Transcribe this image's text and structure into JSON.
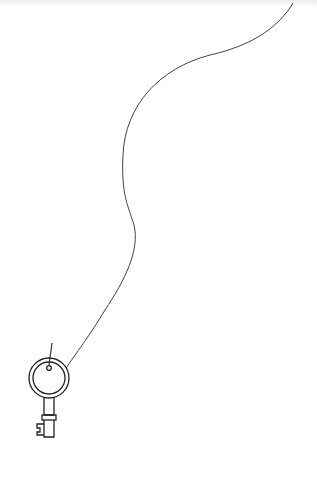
{
  "illustration": {
    "subject": "key hanging from a string",
    "background_color": "#ffffff",
    "line_color": "#333333"
  }
}
